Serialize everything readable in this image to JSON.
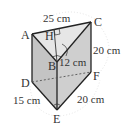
{
  "figure": {
    "type": "triangular prism",
    "vertices": {
      "A": "A",
      "B": "B",
      "C": "C",
      "D": "D",
      "E": "E",
      "F": "F",
      "H": "H"
    },
    "measurements": {
      "AC": "25 cm",
      "BH": "12 cm",
      "CF": "20 cm",
      "DE": "15 cm",
      "EF": "20 cm"
    },
    "colors": {
      "face_front": "#c8c8c8",
      "face_top": "#e4e4e4",
      "edge": "#222222",
      "dashed": "#555555"
    }
  }
}
